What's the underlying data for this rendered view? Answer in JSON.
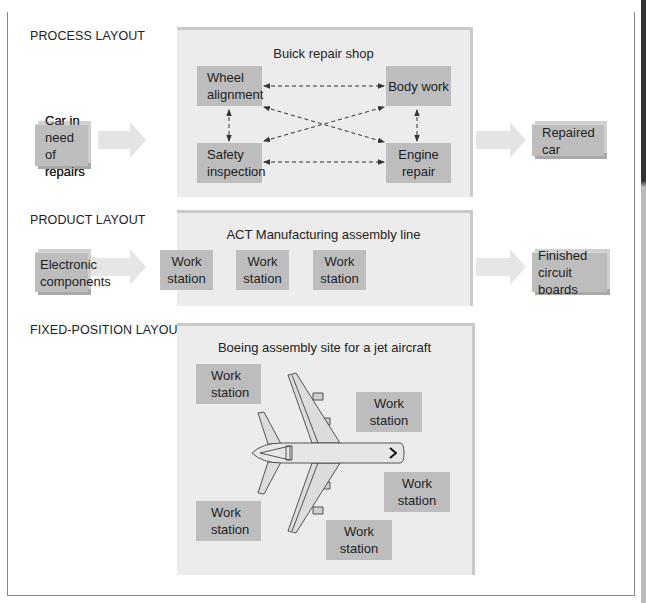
{
  "caption_clipped": "                   ",
  "sections": {
    "process": {
      "label": "PROCESS LAYOUT",
      "panel_title": "Buick repair shop",
      "input": [
        "Car in need",
        "of repairs"
      ],
      "output": "Repaired car",
      "departments": {
        "wheel": [
          "Wheel",
          "alignment"
        ],
        "body": "Body work",
        "safety": [
          "Safety",
          "inspection"
        ],
        "engine": [
          "Engine",
          "repair"
        ]
      },
      "connections": "dashed bidirectional links between all four departments"
    },
    "product": {
      "label": "PRODUCT LAYOUT",
      "panel_title": "ACT Manufacturing assembly line",
      "input": [
        "Electronic",
        "components"
      ],
      "output": [
        "Finished",
        "circuit boards"
      ],
      "stations": [
        [
          "Work",
          "station"
        ],
        [
          "Work",
          "station"
        ],
        [
          "Work",
          "station"
        ]
      ]
    },
    "fixed": {
      "label": "FIXED-POSITION LAYOUT",
      "panel_title": "Boeing assembly site for a jet aircraft",
      "stations": [
        [
          "Work",
          "station"
        ],
        [
          "Work",
          "station"
        ],
        [
          "Work",
          "station"
        ],
        [
          "Work",
          "station"
        ],
        [
          "Work",
          "station"
        ]
      ],
      "center_icon": "jet-aircraft-icon"
    }
  },
  "colors": {
    "panel_bg": "#ececec",
    "box_bg": "#bdbdbd",
    "arrow_fill": "#e2e2e2",
    "line": "#333333"
  }
}
